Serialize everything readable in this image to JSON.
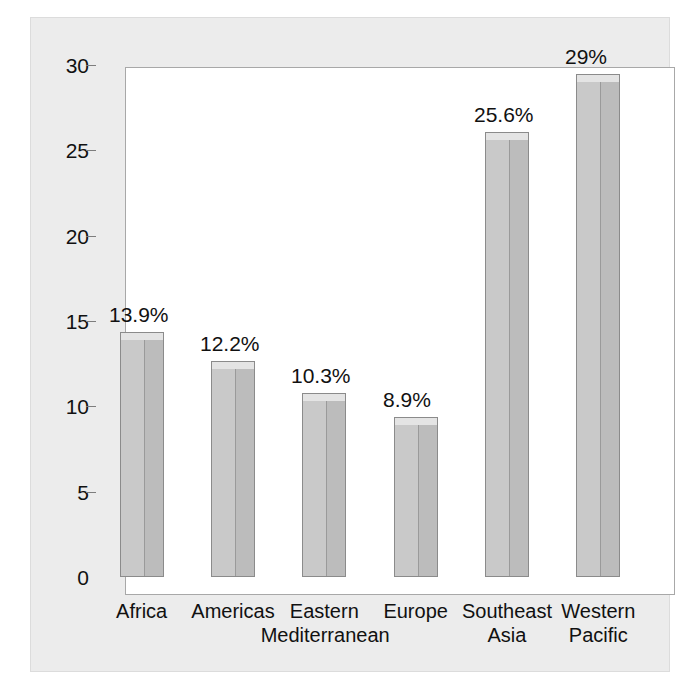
{
  "chart_data": {
    "type": "bar",
    "title": "",
    "xlabel": "",
    "ylabel": "",
    "ylim": [
      0,
      30
    ],
    "yticks": [
      0,
      5,
      10,
      15,
      20,
      25,
      30
    ],
    "ytick_labels": [
      "0",
      "5",
      "10",
      "15",
      "20",
      "25",
      "30"
    ],
    "grid": false,
    "legend": "none",
    "categories": [
      "Africa",
      "Americas",
      "Eastern\nMediterranean",
      "Europe",
      "Southeast\nAsia",
      "Western\nPacific"
    ],
    "values": [
      13.9,
      12.2,
      10.3,
      8.9,
      25.6,
      29.0
    ],
    "data_labels": [
      "13.9%",
      "12.2%",
      "10.3%",
      "8.9%",
      "25.6%",
      "29%"
    ],
    "bar_style": "3d-column",
    "colors": {
      "bar_front": "#c9c9c9",
      "bar_side": "#bcbcbc",
      "bar_top": "#e4e4e4",
      "bar_outline": "#8b8b8b",
      "plot_background": "#ffffff",
      "panel_background": "#ececec",
      "axis": "#7d7d7d",
      "text": "#111111"
    }
  }
}
